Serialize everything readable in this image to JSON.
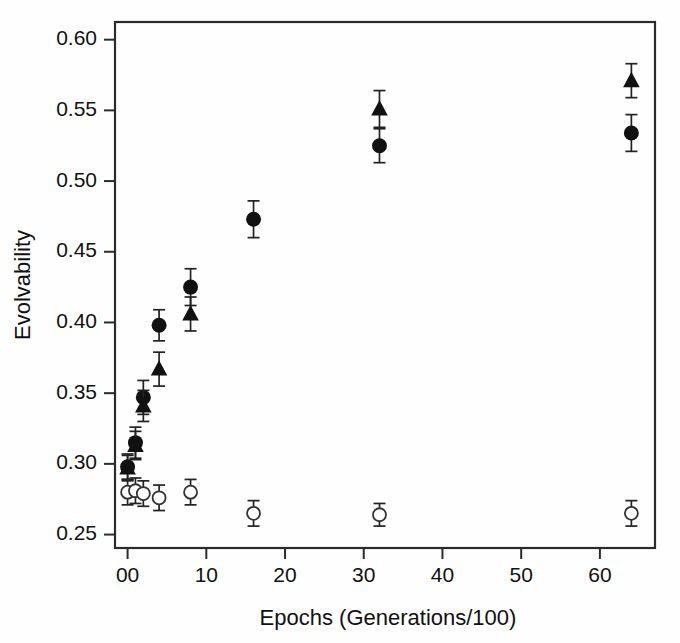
{
  "figure": {
    "background": "#fefefe",
    "frame_color": "#2b2b2b"
  },
  "chart_data": {
    "type": "scatter",
    "title": "",
    "xlabel": "Epochs (Generations/100)",
    "ylabel": "Evolvability",
    "xlim": [
      -1.6,
      67
    ],
    "ylim": [
      0.2405,
      0.6125
    ],
    "grid": false,
    "legend": "none",
    "xticks": [
      0,
      10,
      20,
      30,
      40,
      50,
      60
    ],
    "xtick_labels": [
      "00",
      "10",
      "20",
      "30",
      "40",
      "50",
      "60"
    ],
    "yticks": [
      0.25,
      0.3,
      0.35,
      0.4,
      0.45,
      0.5,
      0.55,
      0.6
    ],
    "ytick_labels": [
      "0.25",
      "0.30",
      "0.35",
      "0.40",
      "0.45",
      "0.50",
      "0.55",
      "0.60"
    ],
    "error_bars": "symmetric standard error",
    "series": [
      {
        "name": "filled-circle",
        "marker": "filled-circle",
        "color": "#111111",
        "x": [
          0,
          1,
          2,
          4,
          8,
          16,
          32,
          64
        ],
        "values": [
          0.298,
          0.315,
          0.347,
          0.398,
          0.425,
          0.473,
          0.525,
          0.534
        ],
        "errors": [
          0.009,
          0.011,
          0.012,
          0.011,
          0.013,
          0.013,
          0.012,
          0.013
        ]
      },
      {
        "name": "filled-triangle",
        "marker": "filled-triangle",
        "color": "#111111",
        "x": [
          0,
          1,
          2,
          4,
          8,
          32,
          64
        ],
        "values": [
          0.297,
          0.313,
          0.341,
          0.367,
          0.406,
          0.551,
          0.571
        ],
        "errors": [
          0.009,
          0.01,
          0.011,
          0.012,
          0.012,
          0.013,
          0.012
        ]
      },
      {
        "name": "open-circle",
        "marker": "open-circle",
        "color": "#ffffff",
        "x": [
          0,
          1,
          2,
          4,
          8,
          16,
          32,
          64
        ],
        "values": [
          0.28,
          0.281,
          0.279,
          0.276,
          0.28,
          0.265,
          0.264,
          0.265
        ],
        "errors": [
          0.009,
          0.009,
          0.009,
          0.009,
          0.009,
          0.009,
          0.008,
          0.009
        ]
      }
    ]
  }
}
